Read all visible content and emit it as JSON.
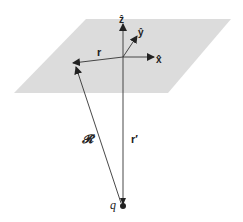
{
  "diagram": {
    "plane_color": "#dcdcdc",
    "line_color": "#333333",
    "labels": {
      "z_hat": "ẑ",
      "y_hat": "ŷ",
      "x_hat": "x̂",
      "r": "r",
      "script_r": "𝓡",
      "r_prime": "r′",
      "charge": "q"
    },
    "elements": [
      {
        "name": "plane",
        "type": "parallelogram"
      },
      {
        "name": "z-axis",
        "label": "ẑ"
      },
      {
        "name": "y-axis",
        "label": "ŷ"
      },
      {
        "name": "x-axis",
        "label": "x̂"
      },
      {
        "name": "vector-r",
        "label": "r"
      },
      {
        "name": "vector-script-r",
        "label": "𝓡"
      },
      {
        "name": "vector-r-prime",
        "label": "r′"
      },
      {
        "name": "point-charge",
        "label": "q"
      }
    ]
  }
}
